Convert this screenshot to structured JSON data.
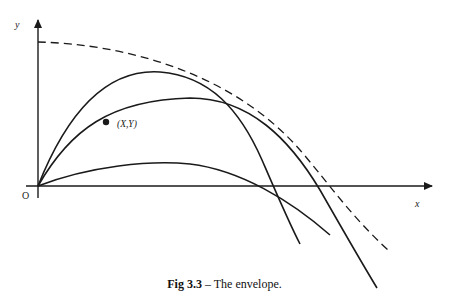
{
  "figure": {
    "caption_label": "Fig 3.3",
    "caption_text": " – The envelope.",
    "axis_y_label": "y",
    "axis_x_label": "x",
    "origin_label": "O",
    "point_label": "(X,Y)"
  },
  "colors": {
    "stroke": "#1a1a1a",
    "background": "#ffffff"
  }
}
